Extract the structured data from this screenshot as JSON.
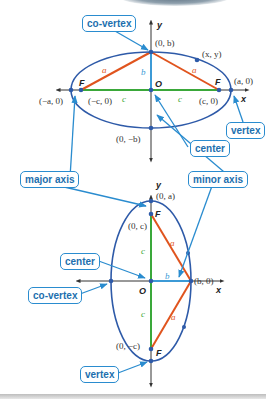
{
  "colors": {
    "ellipse": "#2e5aa8",
    "axis": "#333333",
    "major_segment": "#3aa83a",
    "minor_segment": "#3c9ad6",
    "focal_segment": "#e0541e",
    "callout_border": "#2a8ccf",
    "callout_text": "#1d6fae",
    "point": "#2e5aa8"
  },
  "horizontal_ellipse": {
    "axes": {
      "x": "x",
      "y": "y"
    },
    "points": {
      "co_vertex_top": "(0, b)",
      "co_vertex_bottom": "(0, −b)",
      "vertex_left": "(−a, 0)",
      "vertex_right": "(a, 0)",
      "focus_left": "(−c, 0)",
      "focus_right": "(c, 0)",
      "general_point": "(x, y)"
    },
    "focus_labels": {
      "left": "F",
      "right": "F"
    },
    "center_label": "O",
    "segment_labels": {
      "a_left": "a",
      "a_right": "a",
      "b": "b",
      "c_left": "c",
      "c_right": "c"
    },
    "callouts": {
      "co_vertex": "co-vertex",
      "vertex": "vertex",
      "center": "center",
      "major_axis": "major axis",
      "minor_axis": "minor axis"
    }
  },
  "vertical_ellipse": {
    "axes": {
      "x": "x",
      "y": "y"
    },
    "points": {
      "vertex_top": "(0, a)",
      "focus_top": "(0, c)",
      "focus_bottom": "(0, −c)",
      "co_vertex_right": "(b, 0)"
    },
    "focus_labels": {
      "top": "F",
      "bottom": "F"
    },
    "center_label": "O",
    "segment_labels": {
      "a_top": "a",
      "a_bottom": "a",
      "b": "b",
      "c_top": "c",
      "c_bottom": "c"
    },
    "callouts": {
      "center": "center",
      "co_vertex": "co-vertex",
      "vertex": "vertex"
    }
  }
}
